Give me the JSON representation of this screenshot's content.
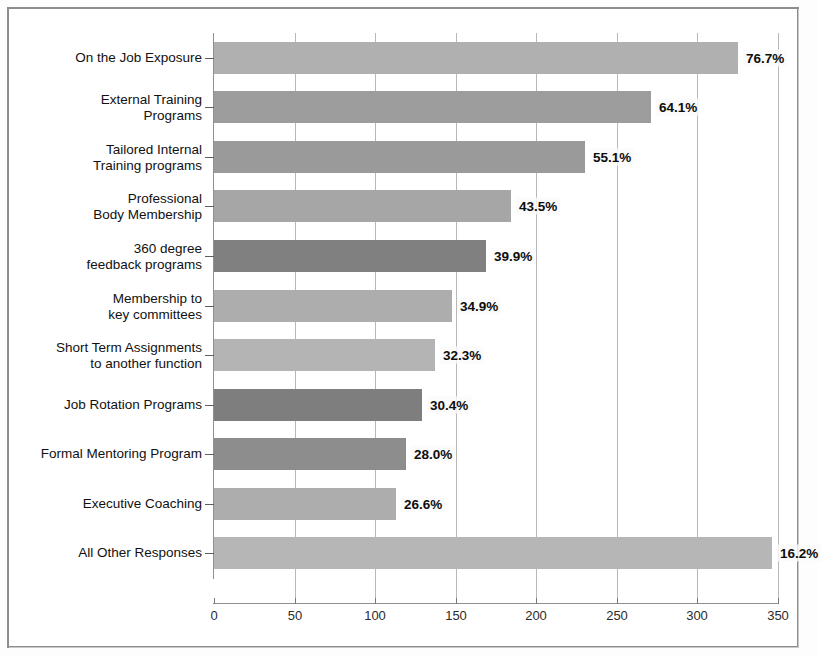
{
  "chart_data": {
    "type": "bar",
    "orientation": "horizontal",
    "title": "",
    "subtitle": "",
    "xlabel": "",
    "ylabel": "",
    "xlim": [
      0,
      350
    ],
    "xticks": [
      0,
      50,
      100,
      150,
      200,
      250,
      300,
      350
    ],
    "xtick_labels": [
      "0",
      "50",
      "100",
      "150",
      "200",
      "250",
      "300",
      "350"
    ],
    "grid": "vertical",
    "legend": "none",
    "categories": [
      "On the Job Exposure",
      "External Training\nPrograms",
      "Tailored Internal\nTraining programs",
      "Professional\nBody Membership",
      "360 degree\nfeedback programs",
      "Membership to\nkey committees",
      "Short Term Assignments\nto another function",
      "Job Rotation Programs",
      "Formal Mentoring Program",
      "Executive Coaching",
      "All Other Responses"
    ],
    "values": [
      325,
      271,
      230,
      184,
      169,
      148,
      137,
      129,
      119,
      113,
      346
    ],
    "data_labels": [
      "76.7%",
      "64.1%",
      "55.1%",
      "43.5%",
      "39.9%",
      "34.9%",
      "32.3%",
      "30.4%",
      "28.0%",
      "26.6%",
      "16.2%"
    ],
    "bar_colors": [
      "#b0b0b0",
      "#9d9d9d",
      "#9a9a9a",
      "#a6a6a6",
      "#808080",
      "#adadad",
      "#b4b4b4",
      "#7e7e7e",
      "#8d8d8d",
      "#adadad",
      "#b6b6b6"
    ]
  },
  "style": {
    "axis_color": "#8f8f8f",
    "grid_color": "#b8b8b8",
    "frame_color": "#8d8d8d",
    "label_color": "#111111",
    "value_color": "#0d0d0d",
    "background": "#ffffff"
  }
}
